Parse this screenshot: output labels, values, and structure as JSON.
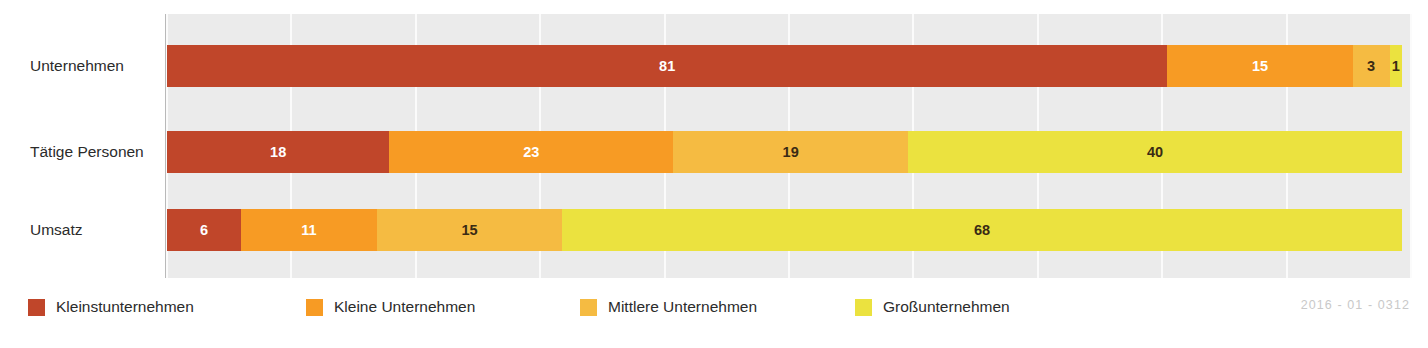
{
  "chart_data": {
    "type": "bar",
    "orientation": "horizontal",
    "stacked": true,
    "normalized_percent": true,
    "title": "",
    "subtitle": "",
    "xlabel": "",
    "ylabel": "",
    "xlim": [
      0,
      100
    ],
    "grid": true,
    "gridline_values": [
      0,
      10,
      20,
      30,
      40,
      50,
      60,
      70,
      80,
      90,
      100
    ],
    "legend_position": "bottom",
    "categories": [
      "Unternehmen",
      "Tätige Personen",
      "Umsatz"
    ],
    "series": [
      {
        "name": "Kleinstunternehmen",
        "color": "#c0462a",
        "values": [
          81,
          18,
          6
        ]
      },
      {
        "name": "Kleine Unternehmen",
        "color": "#f79b24",
        "values": [
          15,
          23,
          11
        ]
      },
      {
        "name": "Mittlere Unternehmen",
        "color": "#f5bb42",
        "values": [
          3,
          19,
          15
        ]
      },
      {
        "name": "Großunternehmen",
        "color": "#ebe23f",
        "values": [
          1,
          40,
          68
        ]
      }
    ],
    "value_label_colors": [
      [
        "#ffffff",
        "#ffffff",
        "#3a2b14",
        "#3a2b14"
      ],
      [
        "#ffffff",
        "#ffffff",
        "#3a2b14",
        "#3a2b14"
      ],
      [
        "#ffffff",
        "#ffffff",
        "#3a2b14",
        "#3a2b14"
      ]
    ],
    "plot_background": "#ebebeb",
    "gridline_color": "#fbfbfb"
  },
  "axis": {
    "category_labels": [
      {
        "text": "Unternehmen"
      },
      {
        "text": "Tätige Personen"
      },
      {
        "text": "Umsatz"
      }
    ]
  },
  "bars": [
    {
      "category": "Unternehmen",
      "segments": [
        {
          "series": "Kleinstunternehmen",
          "value": 81,
          "label": "81",
          "color": "#c0462a",
          "text_tone": "light"
        },
        {
          "series": "Kleine Unternehmen",
          "value": 15,
          "label": "15",
          "color": "#f79b24",
          "text_tone": "light"
        },
        {
          "series": "Mittlere Unternehmen",
          "value": 3,
          "label": "3",
          "color": "#f5bb42",
          "text_tone": "dark"
        },
        {
          "series": "Großunternehmen",
          "value": 1,
          "label": "1",
          "color": "#ebe23f",
          "text_tone": "dark"
        }
      ]
    },
    {
      "category": "Tätige Personen",
      "segments": [
        {
          "series": "Kleinstunternehmen",
          "value": 18,
          "label": "18",
          "color": "#c0462a",
          "text_tone": "light"
        },
        {
          "series": "Kleine Unternehmen",
          "value": 23,
          "label": "23",
          "color": "#f79b24",
          "text_tone": "light"
        },
        {
          "series": "Mittlere Unternehmen",
          "value": 19,
          "label": "19",
          "color": "#f5bb42",
          "text_tone": "dark"
        },
        {
          "series": "Großunternehmen",
          "value": 40,
          "label": "40",
          "color": "#ebe23f",
          "text_tone": "dark"
        }
      ]
    },
    {
      "category": "Umsatz",
      "segments": [
        {
          "series": "Kleinstunternehmen",
          "value": 6,
          "label": "6",
          "color": "#c0462a",
          "text_tone": "light"
        },
        {
          "series": "Kleine Unternehmen",
          "value": 11,
          "label": "11",
          "color": "#f79b24",
          "text_tone": "light"
        },
        {
          "series": "Mittlere Unternehmen",
          "value": 15,
          "label": "15",
          "color": "#f5bb42",
          "text_tone": "dark"
        },
        {
          "series": "Großunternehmen",
          "value": 68,
          "label": "68",
          "color": "#ebe23f",
          "text_tone": "dark"
        }
      ]
    }
  ],
  "legend": {
    "items": [
      {
        "label": "Kleinstunternehmen",
        "color": "#c0462a",
        "left": 28
      },
      {
        "label": "Kleine Unternehmen",
        "color": "#f79b24",
        "left": 306
      },
      {
        "label": "Mittlere Unternehmen",
        "color": "#f5bb42",
        "left": 580
      },
      {
        "label": "Großunternehmen",
        "color": "#ebe23f",
        "left": 855
      }
    ]
  },
  "footer": {
    "code": "2016 - 01 - 0312"
  }
}
